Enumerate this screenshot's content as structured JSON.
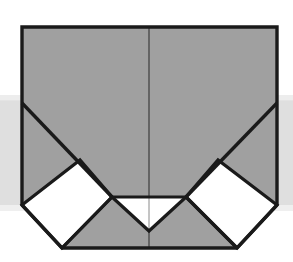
{
  "figure": {
    "title": "Origami fold step diagram",
    "type": "line-drawing",
    "canvas": {
      "width": 293,
      "height": 262
    },
    "colors": {
      "paper_shaded": "#a0a0a0",
      "paper_white": "#ffffff",
      "outline": "#1a1a1a",
      "crease_thin": "#3c3c3c",
      "background": "#ffffff",
      "background_band": "#d4d4d4"
    },
    "geometry": {
      "outer_top_left": [
        22,
        27
      ],
      "outer_top_right": [
        277,
        27
      ],
      "outer_left_lower": [
        22,
        205
      ],
      "outer_right_lower": [
        277,
        205
      ],
      "outer_left_diag_start": [
        22,
        103
      ],
      "outer_right_diag_start": [
        277,
        103
      ],
      "bottom_left_corner": [
        62,
        248
      ],
      "bottom_right_corner": [
        237,
        248
      ],
      "center_vertical_x": 149,
      "center_notch_left": [
        112,
        197
      ],
      "center_notch_right": [
        186,
        197
      ],
      "center_notch_apex": [
        149,
        231
      ],
      "left_diamond": [
        [
          22,
          205
        ],
        [
          80,
          160
        ],
        [
          112,
          197
        ],
        [
          62,
          248
        ]
      ],
      "right_diamond": [
        [
          277,
          205
        ],
        [
          218,
          160
        ],
        [
          186,
          197
        ],
        [
          237,
          248
        ]
      ]
    },
    "background_band": {
      "x": 0,
      "y": 100,
      "width": 293,
      "height": 105
    },
    "labels": []
  }
}
